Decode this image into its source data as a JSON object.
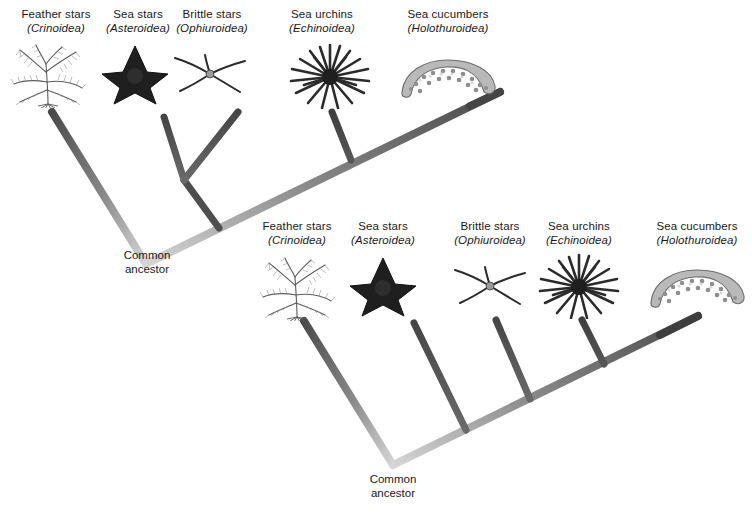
{
  "figure": {
    "background_color": "#ffffff",
    "branch_color_tip": "#4a4a4a",
    "branch_color_root": "#d2d2d2",
    "text_color": "#1a1a1a"
  },
  "taxa": [
    {
      "common": "Feather stars",
      "scientific": "(Crinoidea)",
      "icon": "feather-star-icon"
    },
    {
      "common": "Sea stars",
      "scientific": "(Asteroidea)",
      "icon": "sea-star-icon"
    },
    {
      "common": "Brittle stars",
      "scientific": "(Ophiuroidea)",
      "icon": "brittle-star-icon"
    },
    {
      "common": "Sea urchins",
      "scientific": "(Echinoidea)",
      "icon": "sea-urchin-icon"
    },
    {
      "common": "Sea cucumbers",
      "scientific": "(Holothuroidea)",
      "icon": "sea-cucumber-icon"
    }
  ],
  "diagrams": [
    {
      "id": "top-cladogram",
      "root_label_line1": "Common",
      "root_label_line2": "ancestor",
      "topology": "(Crinoidea,((Asteroidea,Ophiuroidea),(Echinoidea,Holothuroidea)))"
    },
    {
      "id": "bottom-cladogram",
      "root_label_line1": "Common",
      "root_label_line2": "ancestor",
      "topology": "(Crinoidea,(Asteroidea,(Ophiuroidea,(Echinoidea,Holothuroidea))))"
    }
  ],
  "labels_top": [
    {
      "common": "Feather stars",
      "scientific": "(Crinoidea)",
      "x": 10,
      "y": 8
    },
    {
      "common": "Sea stars",
      "scientific": "(Asteroidea)",
      "x": 98,
      "y": 8
    },
    {
      "common": "Brittle stars",
      "scientific": "(Ophiuroidea)",
      "x": 170,
      "y": 8
    },
    {
      "common": "Sea urchins",
      "scientific": "(Echinoidea)",
      "x": 277,
      "y": 8
    },
    {
      "common": "Sea cucumbers",
      "scientific": "(Holothuroidea)",
      "x": 404,
      "y": 8
    }
  ],
  "labels_bottom": [
    {
      "common": "Feather stars",
      "scientific": "(Crinoidea)",
      "x": 258,
      "y": 220
    },
    {
      "common": "Sea stars",
      "scientific": "(Asteroidea)",
      "x": 352,
      "y": 220
    },
    {
      "common": "Brittle stars",
      "scientific": "(Ophiuroidea)",
      "x": 450,
      "y": 220
    },
    {
      "common": "Sea urchins",
      "scientific": "(Echinoidea)",
      "x": 537,
      "y": 220
    },
    {
      "common": "Sea cucumbers",
      "scientific": "(Holothuroidea)",
      "x": 650,
      "y": 220
    }
  ],
  "ancestor_top": {
    "line1": "Common",
    "line2": "ancestor",
    "x": 118,
    "y": 250
  },
  "ancestor_bottom": {
    "line1": "Common",
    "line2": "ancestor",
    "x": 362,
    "y": 474
  }
}
